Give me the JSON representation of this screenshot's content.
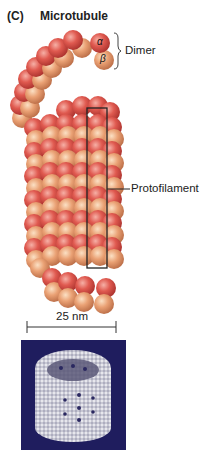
{
  "figure": {
    "panel_letter": "(C)",
    "title": "Microtubule",
    "labels": {
      "dimer": "Dimer",
      "alpha": "α",
      "beta": "β",
      "protofilament": "Protofilament",
      "scale": "25 nm"
    },
    "colors": {
      "alpha_tubulin": "#d9534a",
      "beta_tubulin": "#e8a070",
      "outline": "#222222",
      "em_background": "#1f1d5e",
      "em_structure": "#d8d8e0"
    }
  }
}
